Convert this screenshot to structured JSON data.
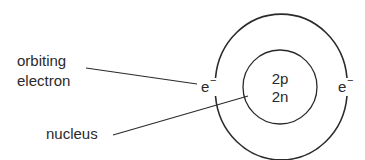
{
  "diagram": {
    "labels": {
      "orbiting_line1": "orbiting",
      "orbiting_line2": "electron",
      "nucleus": "nucleus"
    },
    "nucleus_content": {
      "protons": "2p",
      "neutrons": "2n"
    },
    "electrons": [
      {
        "symbol": "e",
        "charge": "−"
      },
      {
        "symbol": "e",
        "charge": "−"
      }
    ],
    "colors": {
      "stroke": "#2a2a2a",
      "background": "#ffffff"
    }
  }
}
